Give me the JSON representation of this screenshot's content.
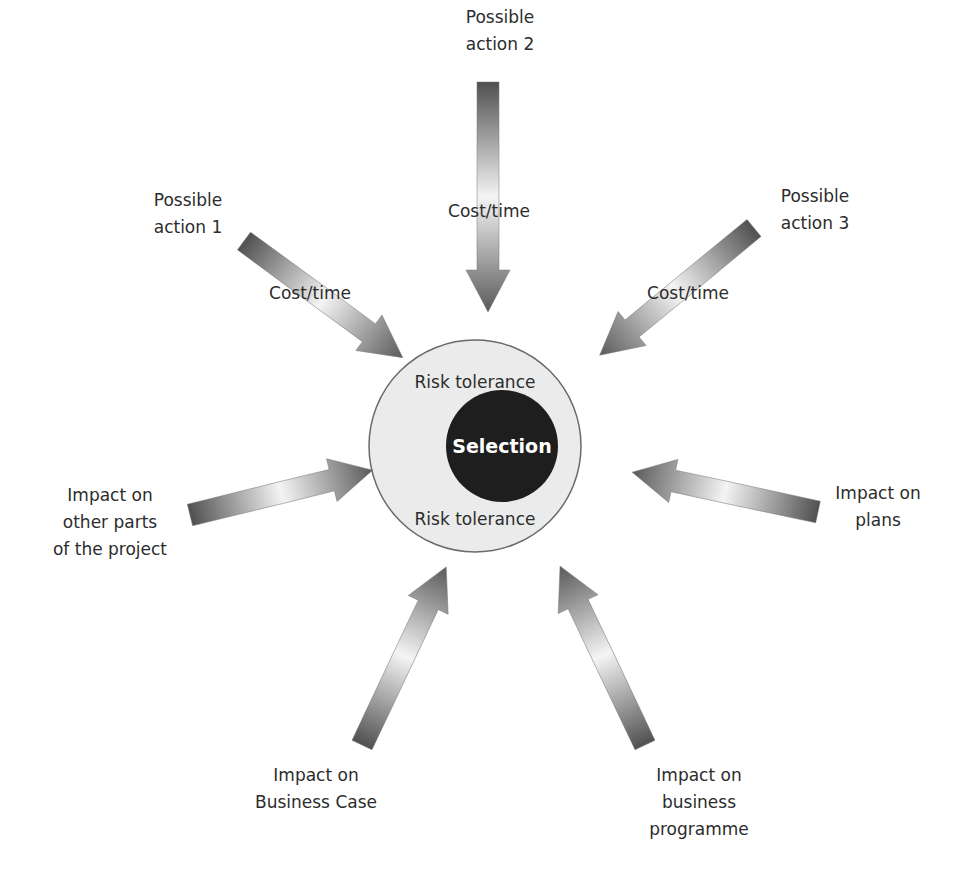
{
  "center": {
    "selection_label": "Selection",
    "risk_tolerance_top": "Risk tolerance",
    "risk_tolerance_bottom": "Risk tolerance"
  },
  "arrows": [
    {
      "id": "possible-action-1",
      "label": [
        "Possible",
        "action 1"
      ],
      "arrow_text": "Cost/time"
    },
    {
      "id": "possible-action-2",
      "label": [
        "Possible",
        "action 2"
      ],
      "arrow_text": "Cost/time"
    },
    {
      "id": "possible-action-3",
      "label": [
        "Possible",
        "action 3"
      ],
      "arrow_text": "Cost/time"
    },
    {
      "id": "impact-other-parts",
      "label": [
        "Impact on",
        "other parts",
        "of the project"
      ]
    },
    {
      "id": "impact-plans",
      "label": [
        "Impact on",
        "plans"
      ]
    },
    {
      "id": "impact-business-case",
      "label": [
        "Impact on",
        "Business Case"
      ]
    },
    {
      "id": "impact-business-programme",
      "label": [
        "Impact on",
        "business",
        "programme"
      ]
    }
  ],
  "colors": {
    "outer_circle_fill": "#ebebeb",
    "outer_circle_stroke": "#666666",
    "inner_circle_fill": "#1e1e1e",
    "arrow_dark": "#4a4a4a",
    "arrow_light": "#f2f2f2"
  }
}
